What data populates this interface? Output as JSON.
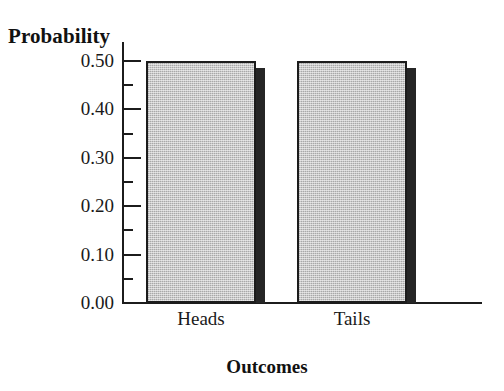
{
  "chart_data": {
    "type": "bar",
    "title": "",
    "subtitle": "",
    "xlabel": "Outcomes",
    "ylabel": "Probability",
    "categories": [
      "Heads",
      "Tails"
    ],
    "values": [
      0.5,
      0.5
    ],
    "series": [
      {
        "name": "Probability",
        "values": [
          0.5,
          0.5
        ]
      }
    ],
    "ylim": [
      0.0,
      0.5
    ],
    "ytick_labels": [
      "0.50",
      "0.40",
      "0.30",
      "0.20",
      "0.10",
      "0.00"
    ],
    "ytick_values": [
      0.5,
      0.4,
      0.3,
      0.2,
      0.1,
      0.0
    ],
    "minor_tick_values": [
      0.55,
      0.45,
      0.35,
      0.25,
      0.15,
      0.05
    ],
    "grid": false,
    "legend": false,
    "legend_position": "none",
    "bar_fill_color": "#c9c9c9",
    "bar_edge_color": "#1c1c1c",
    "bar_shadow_color": "#262626",
    "axis_color": "#1c1c1c",
    "background_color": "#ffffff"
  },
  "axes": {
    "y_title": "Probability",
    "x_title": "Outcomes"
  },
  "ticks": [
    {
      "label": "0.50",
      "value": 0.5
    },
    {
      "label": "0.40",
      "value": 0.4
    },
    {
      "label": "0.30",
      "value": 0.3
    },
    {
      "label": "0.20",
      "value": 0.2
    },
    {
      "label": "0.10",
      "value": 0.1
    },
    {
      "label": "0.00",
      "value": 0.0
    }
  ],
  "bars": [
    {
      "category": "Heads",
      "value": 0.5
    },
    {
      "category": "Tails",
      "value": 0.5
    }
  ]
}
